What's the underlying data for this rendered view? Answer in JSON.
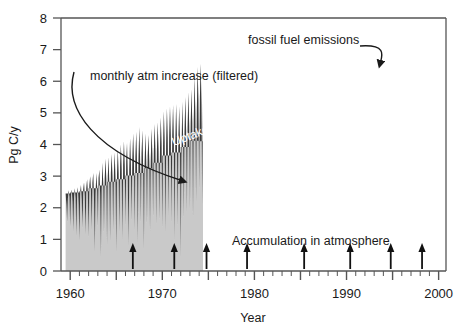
{
  "chart_data": {
    "type": "area",
    "title": "",
    "subtitle": "",
    "xlabel": "Year",
    "ylabel": "Pg C/y",
    "xlim": [
      1959.0,
      2000.8
    ],
    "ylim": [
      0,
      8
    ],
    "yticks": [
      0,
      1,
      2,
      3,
      4,
      5,
      6,
      7,
      8
    ],
    "ytick_labels": [
      "0",
      "1",
      "2",
      "3",
      "4",
      "5",
      "6",
      "7",
      "8"
    ],
    "xticks": [
      1960,
      1970,
      1980,
      1990,
      2000
    ],
    "xtick_labels": [
      "1960",
      "1970",
      "1980",
      "1990",
      "2000"
    ],
    "minor_xtick_interval": 1,
    "grid": false,
    "legend": "none",
    "colors": {
      "fossil_fuel_band": "#3b3b3b",
      "accumulation_band": "#c9c9c9",
      "axis": "#555555",
      "text": "#1a1a1a",
      "curved_label_text": "#ffffff"
    },
    "annotations": [
      {
        "name": "monthly-atm-increase-label",
        "text": "monthly atm increase (filtered)",
        "x": 90,
        "y": 78,
        "arrow_to": [
          196,
          180
        ]
      },
      {
        "name": "fossil-fuel-emissions-label",
        "text": "fossil fuel emissions",
        "x": 248,
        "y": 43,
        "arrow_to": [
          378,
          72
        ]
      },
      {
        "name": "uptake-label",
        "text": "Uptake by ocean and land biosphere",
        "curved": true
      },
      {
        "name": "accumulation-label",
        "text": "Accumulation in atmosphere",
        "x": 232,
        "y": 243
      }
    ],
    "event_arrow_years": [
      1966.8,
      1971.3,
      1974.8,
      1979.2,
      1985.4,
      1990.4,
      1994.8,
      1998.2
    ],
    "series": [
      {
        "name": "fossil fuel emissions",
        "note": "annual step function, upper envelope of dark band",
        "x": [
          1959,
          1960,
          1961,
          1962,
          1963,
          1964,
          1965,
          1966,
          1967,
          1968,
          1969,
          1970,
          1971,
          1972,
          1973,
          1974,
          1975,
          1976,
          1977,
          1978,
          1979,
          1980,
          1981,
          1982,
          1983,
          1984,
          1985,
          1986,
          1987,
          1988,
          1989,
          1990,
          1991,
          1992,
          1993,
          1994,
          1995,
          1996,
          1997,
          1998,
          1999,
          2000
        ],
        "values": [
          2.45,
          2.48,
          2.52,
          2.62,
          2.7,
          2.82,
          2.9,
          3.02,
          3.1,
          3.25,
          3.42,
          3.65,
          3.75,
          3.92,
          4.12,
          4.1,
          4.02,
          4.25,
          4.38,
          4.45,
          4.62,
          4.55,
          4.4,
          4.35,
          4.35,
          4.5,
          4.65,
          4.75,
          4.9,
          5.1,
          5.2,
          5.25,
          5.3,
          5.22,
          5.28,
          5.4,
          5.55,
          5.7,
          5.8,
          6.2,
          6.45,
          6.55
        ]
      },
      {
        "name": "accumulation in atmosphere (monthly atm increase, filtered)",
        "note": "lower light-gray band; monthly values oscillating 0.4 to 5.5",
        "x_start": 1959.5,
        "x_end": 2000.5,
        "mean_level": 3.0,
        "min": 0.35,
        "max": 6.6
      },
      {
        "name": "uptake by ocean and land biosphere",
        "note": "dark region between fossil fuel step curve and monthly accumulation curve"
      }
    ],
    "monthly_accumulation": [
      2.45,
      2.1,
      1.55,
      2.3,
      2.55,
      2.35,
      1.4,
      2.4,
      2.58,
      2.2,
      1.25,
      2.35,
      2.62,
      2.3,
      1.1,
      2.45,
      2.65,
      2.1,
      0.95,
      2.5,
      2.72,
      2.25,
      1.35,
      2.58,
      2.8,
      2.35,
      1.15,
      2.62,
      2.9,
      2.45,
      1.05,
      2.7,
      3.0,
      2.55,
      1.3,
      2.8,
      3.1,
      2.3,
      0.6,
      2.4,
      3.1,
      2.65,
      1.4,
      2.95,
      3.2,
      2.4,
      0.45,
      2.55,
      3.42,
      2.8,
      1.2,
      2.95,
      3.55,
      2.9,
      0.85,
      3.0,
      3.6,
      2.7,
      0.95,
      3.1,
      3.7,
      3.0,
      1.3,
      3.15,
      3.75,
      2.85,
      0.6,
      3.05,
      3.85,
      3.1,
      1.25,
      3.3,
      4.0,
      3.2,
      1.0,
      3.35,
      4.1,
      3.3,
      1.45,
      3.45,
      4.05,
      3.0,
      0.8,
      3.2,
      4.2,
      3.4,
      1.6,
      3.55,
      4.35,
      3.5,
      1.3,
      3.6,
      4.4,
      3.45,
      0.9,
      3.5,
      4.55,
      3.6,
      1.55,
      3.7,
      4.45,
      3.3,
      0.7,
      3.4,
      4.35,
      3.5,
      1.5,
      3.65,
      4.3,
      3.45,
      1.25,
      3.55,
      4.5,
      3.7,
      1.7,
      3.8,
      4.65,
      3.8,
      1.45,
      3.85,
      4.7,
      3.85,
      1.6,
      3.9,
      4.85,
      4.0,
      1.35,
      3.95,
      5.05,
      4.1,
      1.2,
      4.0,
      5.15,
      4.2,
      1.75,
      4.25,
      5.2,
      4.3,
      1.5,
      4.3,
      5.25,
      4.15,
      0.95,
      4.05,
      5.28,
      4.25,
      1.4,
      4.2,
      5.2,
      4.0,
      0.4,
      3.6,
      5.35,
      4.35,
      1.65,
      4.4,
      5.5,
      4.45,
      1.85,
      4.55,
      5.65,
      4.6,
      1.95,
      4.7,
      5.75,
      4.7,
      1.7,
      4.75,
      6.15,
      5.0,
      2.2,
      5.1,
      6.45,
      5.4,
      2.6,
      5.5,
      6.55,
      5.3,
      2.1,
      5.35
    ]
  },
  "figure": {
    "width": 458,
    "height": 336
  }
}
